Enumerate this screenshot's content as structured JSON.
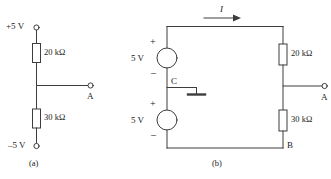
{
  "figure": {
    "type": "circuit-diagram",
    "background_color": "#ffffff",
    "line_color": "#3d3d3d",
    "text_color": "#1a1a1a"
  },
  "circuit_a": {
    "caption": "(a)",
    "supply_positive_label": "+5 V",
    "supply_negative_label": "–5 V",
    "resistor_top_label": "20 kΩ",
    "resistor_bottom_label": "30 kΩ",
    "node_label": "A"
  },
  "circuit_b": {
    "caption": "(b)",
    "current_label": "I",
    "source_top_label": "5 V",
    "source_top_plus": "+",
    "source_top_minus": "–",
    "source_bottom_label": "5 V",
    "source_bottom_plus": "+",
    "source_bottom_minus": "–",
    "resistor_top_label": "20 kΩ",
    "resistor_bottom_label": "30 kΩ",
    "node_a_label": "A",
    "node_b_label": "B",
    "node_c_label": "C",
    "ground_symbol": "earth-ground"
  }
}
